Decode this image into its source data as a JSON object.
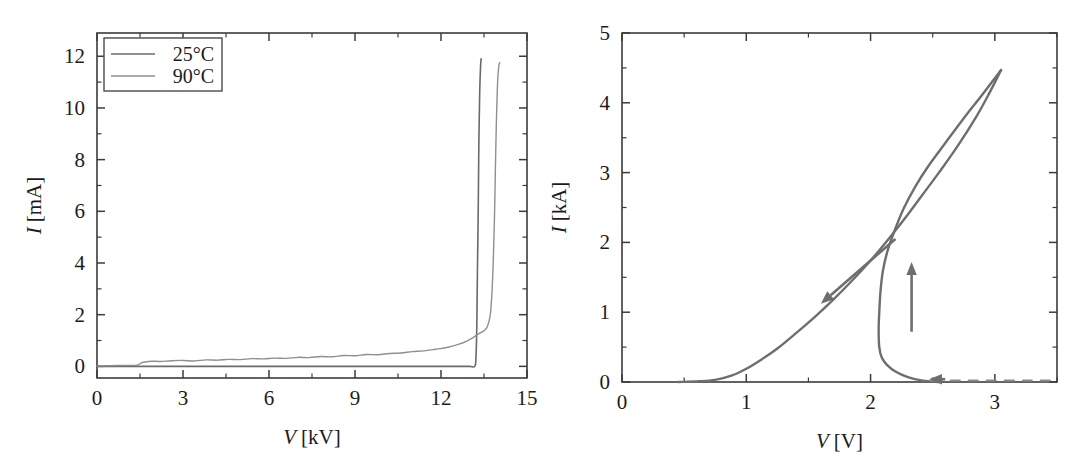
{
  "figure": {
    "background": "#ffffff",
    "panel_count": 2
  },
  "chart_data": [
    {
      "type": "line",
      "id": "left-panel",
      "title": "",
      "xlabel": "V [kV]",
      "ylabel": "I [mA]",
      "xlabel_symbol": "V",
      "xlabel_unit": "[kV]",
      "ylabel_symbol": "I",
      "ylabel_unit": "[mA]",
      "xlim": [
        0,
        15
      ],
      "ylim": [
        -0.45,
        12.9
      ],
      "xticks": [
        0,
        3,
        6,
        9,
        12,
        15
      ],
      "xtick_labels": [
        "0",
        "3",
        "6",
        "9",
        "12",
        "15"
      ],
      "xminor_step": 1.5,
      "yticks": [
        0,
        2,
        4,
        6,
        8,
        10,
        12
      ],
      "ytick_labels": [
        "0",
        "2",
        "4",
        "6",
        "8",
        "10",
        "12"
      ],
      "yminor_step": 1,
      "grid": false,
      "legend_position": "upper-left",
      "series": [
        {
          "name": "25°C",
          "color": "#6a6a6a",
          "linewidth": 1.6,
          "points": [
            [
              0.0,
              0.0
            ],
            [
              1.0,
              0.0
            ],
            [
              2.0,
              0.0
            ],
            [
              3.0,
              0.0
            ],
            [
              4.0,
              0.0
            ],
            [
              5.0,
              0.0
            ],
            [
              6.0,
              0.0
            ],
            [
              7.0,
              0.0
            ],
            [
              8.0,
              0.0
            ],
            [
              9.0,
              0.0
            ],
            [
              10.0,
              0.0
            ],
            [
              11.0,
              0.0
            ],
            [
              12.0,
              0.0
            ],
            [
              12.6,
              0.0
            ],
            [
              13.0,
              0.0
            ],
            [
              13.18,
              0.0
            ],
            [
              13.22,
              0.35
            ],
            [
              13.25,
              1.6
            ],
            [
              13.27,
              3.6
            ],
            [
              13.3,
              6.2
            ],
            [
              13.32,
              8.6
            ],
            [
              13.35,
              10.6
            ],
            [
              13.38,
              11.6
            ],
            [
              13.4,
              11.9
            ]
          ]
        },
        {
          "name": "90°C",
          "color": "#8f8f8f",
          "linewidth": 1.4,
          "points": [
            [
              0.0,
              0.02
            ],
            [
              0.5,
              0.03
            ],
            [
              1.0,
              0.04
            ],
            [
              1.4,
              0.05
            ],
            [
              1.6,
              0.16
            ],
            [
              1.9,
              0.2
            ],
            [
              2.2,
              0.19
            ],
            [
              2.6,
              0.22
            ],
            [
              3.0,
              0.23
            ],
            [
              3.4,
              0.21
            ],
            [
              3.8,
              0.25
            ],
            [
              4.2,
              0.24
            ],
            [
              4.6,
              0.27
            ],
            [
              5.0,
              0.26
            ],
            [
              5.4,
              0.3
            ],
            [
              5.8,
              0.29
            ],
            [
              6.2,
              0.32
            ],
            [
              6.6,
              0.31
            ],
            [
              7.0,
              0.35
            ],
            [
              7.4,
              0.34
            ],
            [
              7.8,
              0.38
            ],
            [
              8.2,
              0.37
            ],
            [
              8.6,
              0.42
            ],
            [
              9.0,
              0.41
            ],
            [
              9.4,
              0.46
            ],
            [
              9.8,
              0.45
            ],
            [
              10.2,
              0.5
            ],
            [
              10.6,
              0.52
            ],
            [
              11.0,
              0.57
            ],
            [
              11.4,
              0.6
            ],
            [
              11.8,
              0.66
            ],
            [
              12.2,
              0.73
            ],
            [
              12.6,
              0.85
            ],
            [
              12.9,
              0.98
            ],
            [
              13.1,
              1.1
            ],
            [
              13.3,
              1.25
            ],
            [
              13.5,
              1.38
            ],
            [
              13.62,
              1.55
            ],
            [
              13.72,
              2.0
            ],
            [
              13.78,
              2.9
            ],
            [
              13.83,
              4.3
            ],
            [
              13.87,
              6.0
            ],
            [
              13.9,
              7.8
            ],
            [
              13.93,
              9.4
            ],
            [
              13.96,
              10.6
            ],
            [
              13.99,
              11.3
            ],
            [
              14.02,
              11.65
            ],
            [
              14.05,
              11.75
            ]
          ]
        }
      ],
      "legend": [
        {
          "label": "25°C",
          "color": "#6a6a6a"
        },
        {
          "label": "90°C",
          "color": "#8f8f8f"
        }
      ]
    },
    {
      "type": "line",
      "id": "right-panel",
      "title": "",
      "xlabel": "V [V]",
      "ylabel": "I [kA]",
      "xlabel_symbol": "V",
      "xlabel_unit": "[V]",
      "ylabel_symbol": "I",
      "ylabel_unit": "[kA]",
      "xlim": [
        0,
        3.5
      ],
      "ylim": [
        0,
        5
      ],
      "xticks": [
        0,
        1,
        2,
        3
      ],
      "xtick_labels": [
        "0",
        "1",
        "2",
        "3"
      ],
      "xminor_step": 0.5,
      "yticks": [
        0,
        1,
        2,
        3,
        4,
        5
      ],
      "ytick_labels": [
        "0",
        "1",
        "2",
        "3",
        "4",
        "5"
      ],
      "yminor_step": 0.5,
      "grid": false,
      "legend_position": "none",
      "series": [
        {
          "name": "down-sweep-branch",
          "color": "#6e6e6e",
          "linewidth": 2.4,
          "style": "solid",
          "points": [
            [
              0.45,
              0.0
            ],
            [
              0.62,
              0.01
            ],
            [
              0.75,
              0.03
            ],
            [
              0.88,
              0.09
            ],
            [
              1.0,
              0.19
            ],
            [
              1.12,
              0.32
            ],
            [
              1.25,
              0.48
            ],
            [
              1.4,
              0.7
            ],
            [
              1.55,
              0.93
            ],
            [
              1.7,
              1.18
            ],
            [
              1.85,
              1.45
            ],
            [
              2.0,
              1.74
            ],
            [
              2.15,
              2.06
            ],
            [
              2.3,
              2.4
            ],
            [
              2.45,
              2.76
            ],
            [
              2.55,
              3.0
            ],
            [
              2.7,
              3.38
            ],
            [
              2.85,
              3.8
            ],
            [
              2.95,
              4.12
            ],
            [
              3.05,
              4.47
            ]
          ]
        },
        {
          "name": "up-sweep-branch",
          "color": "#6e6e6e",
          "linewidth": 2.4,
          "style": "solid",
          "points": [
            [
              2.55,
              0.0
            ],
            [
              2.42,
              0.02
            ],
            [
              2.3,
              0.07
            ],
            [
              2.2,
              0.15
            ],
            [
              2.13,
              0.25
            ],
            [
              2.09,
              0.35
            ],
            [
              2.07,
              0.5
            ],
            [
              2.065,
              0.75
            ],
            [
              2.07,
              1.0
            ],
            [
              2.08,
              1.3
            ],
            [
              2.1,
              1.6
            ],
            [
              2.14,
              1.9
            ],
            [
              2.2,
              2.2
            ],
            [
              2.27,
              2.5
            ],
            [
              2.36,
              2.8
            ],
            [
              2.46,
              3.08
            ],
            [
              2.6,
              3.42
            ],
            [
              2.75,
              3.78
            ],
            [
              2.9,
              4.12
            ],
            [
              3.05,
              4.47
            ]
          ]
        },
        {
          "name": "off-state-dashed",
          "color": "#8a8a8a",
          "linewidth": 2.0,
          "style": "dashed",
          "points": [
            [
              2.5,
              0.02
            ],
            [
              2.75,
              0.02
            ],
            [
              3.0,
              0.02
            ],
            [
              3.25,
              0.02
            ],
            [
              3.45,
              0.02
            ]
          ]
        }
      ],
      "annotations": [
        {
          "name": "down-sweep-arrow",
          "direction": "down-left",
          "from": [
            2.2,
            2.05
          ],
          "to": [
            1.6,
            1.12
          ],
          "color": "#6e6e6e"
        },
        {
          "name": "up-sweep-arrow",
          "direction": "up",
          "from": [
            2.33,
            0.72
          ],
          "to": [
            2.33,
            1.72
          ],
          "color": "#6e6e6e"
        },
        {
          "name": "off-state-arrow",
          "direction": "left",
          "from": [
            2.6,
            0.04
          ],
          "to": [
            2.47,
            0.04
          ],
          "color": "#6e6e6e"
        }
      ]
    }
  ]
}
